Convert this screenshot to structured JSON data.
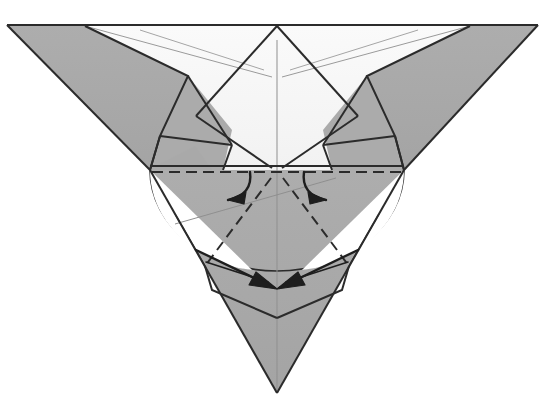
{
  "figure": {
    "type": "origami-instruction-diagram",
    "canvas": {
      "width": 545,
      "height": 419,
      "background": "#ffffff"
    },
    "colors": {
      "paper_back_gray": "#a9a9a9",
      "paper_front_white": "#f6f6f6",
      "paper_mid_gray": "#b4b4b4",
      "outline_dark": "#2b2b2b",
      "crease_light": "#8c8c8c",
      "crease_mid": "#6e6e6e",
      "arrow_dark": "#1e1e1e",
      "background": "#ffffff"
    },
    "line_styles": {
      "outline_width": 2.0,
      "crease_width": 1.0,
      "valley_dash_pattern": "9,5",
      "mountain_dash_pattern": "11,6",
      "arrow_width": 2.4
    },
    "key_points": {
      "top_left_corner": [
        7,
        25
      ],
      "top_right_corner": [
        538,
        25
      ],
      "top_apex": [
        277,
        25
      ],
      "center_hinge": [
        277,
        170
      ],
      "bottom_apex": [
        277,
        393
      ],
      "horizontal_fold_left_end": [
        150,
        170
      ],
      "horizontal_fold_right_end": [
        404,
        170
      ],
      "ellipse_center": [
        277,
        172
      ],
      "ellipse_rx": 128,
      "ellipse_ry": 100
    },
    "shapes": [
      {
        "name": "left-outer-wing",
        "fill": "paper_back_gray"
      },
      {
        "name": "right-outer-wing",
        "fill": "paper_back_gray"
      },
      {
        "name": "upper-white-panel",
        "fill": "paper_front_white"
      },
      {
        "name": "left-inner-flap",
        "fill": "paper_back_gray"
      },
      {
        "name": "right-inner-flap",
        "fill": "paper_back_gray"
      },
      {
        "name": "lower-point-body",
        "fill": "paper_back_gray"
      },
      {
        "name": "rotation-ellipse-guide",
        "fill": "none"
      }
    ],
    "annotations": {
      "fold_line_label": "valley fold (dashed horizontal)",
      "arrow_count": 4,
      "arrows": [
        {
          "name": "upper-left-fold-arrow",
          "direction": "down-left",
          "style": "curved"
        },
        {
          "name": "upper-right-fold-arrow",
          "direction": "down-right",
          "style": "curved"
        },
        {
          "name": "lower-left-tuck-arrow",
          "direction": "down-right",
          "style": "straight"
        },
        {
          "name": "lower-right-tuck-arrow",
          "direction": "down-left",
          "style": "straight"
        }
      ]
    }
  }
}
